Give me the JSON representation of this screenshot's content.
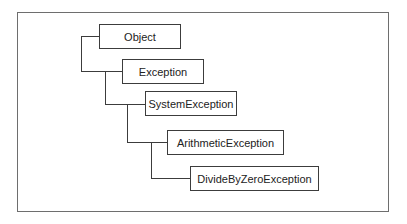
{
  "diagram": {
    "type": "class-hierarchy-tree",
    "nodes": [
      {
        "id": "object",
        "label": "Object",
        "level": 0
      },
      {
        "id": "exception",
        "label": "Exception",
        "level": 1,
        "parent": "object"
      },
      {
        "id": "system-exception",
        "label": "SystemException",
        "level": 2,
        "parent": "exception"
      },
      {
        "id": "arithmetic-exception",
        "label": "ArithmeticException",
        "level": 3,
        "parent": "system-exception"
      },
      {
        "id": "divide-by-zero-exception",
        "label": "DivideByZeroException",
        "level": 4,
        "parent": "arithmetic-exception"
      }
    ],
    "edges": [
      {
        "from": "object",
        "to": "exception"
      },
      {
        "from": "exception",
        "to": "system-exception"
      },
      {
        "from": "system-exception",
        "to": "arithmetic-exception"
      },
      {
        "from": "arithmetic-exception",
        "to": "divide-by-zero-exception"
      }
    ],
    "colors": {
      "frame": "#6e6e6e",
      "box_border": "#3c3c3c",
      "text": "#222222",
      "background": "#ffffff"
    }
  }
}
